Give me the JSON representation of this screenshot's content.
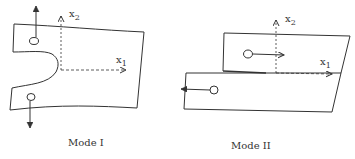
{
  "figures": [
    {
      "id": "mode-1",
      "caption": "Mode I",
      "axis_x1": "x",
      "axis_x1_sub": "1",
      "axis_x2": "x",
      "axis_x2_sub": "2"
    },
    {
      "id": "mode-2",
      "caption": "Mode II",
      "axis_x1": "x",
      "axis_x1_sub": "1",
      "axis_x2": "x",
      "axis_x2_sub": "2"
    }
  ],
  "colors": {
    "stroke": "#333333",
    "background": "#ffffff"
  }
}
